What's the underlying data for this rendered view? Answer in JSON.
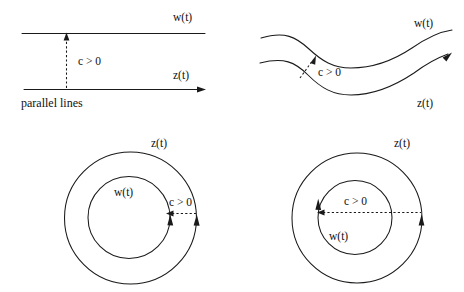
{
  "figure": {
    "title": "",
    "background_color": "#ffffff",
    "ink_color": "#1a1a1a",
    "panels": [
      {
        "id": "top-left",
        "kind": "parallel-lines",
        "caption": "parallel lines",
        "labels": {
          "upper_curve": "w(t)",
          "lower_curve": "z(t)",
          "distance": "c > 0"
        }
      },
      {
        "id": "top-right",
        "kind": "wavy-curves",
        "caption": "",
        "labels": {
          "upper_curve": "w(t)",
          "lower_curve": "z(t)",
          "distance": "c > 0"
        }
      },
      {
        "id": "bottom-left",
        "kind": "concentric-circles",
        "caption": "",
        "labels": {
          "outer_circle": "z(t)",
          "inner_circle": "w(t)",
          "distance": "c > 0"
        }
      },
      {
        "id": "bottom-right",
        "kind": "concentric-circles",
        "caption": "",
        "labels": {
          "outer_circle": "z(t)",
          "inner_circle": "w(t)",
          "distance": "c > 0"
        }
      }
    ]
  }
}
